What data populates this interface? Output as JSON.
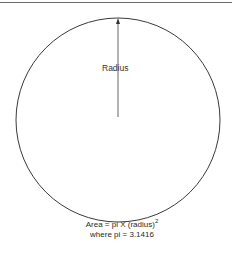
{
  "diagram": {
    "label_radius": "Radius",
    "formula_line1_main": "Area = pi X (radius)",
    "formula_line1_exponent": "2",
    "formula_line2": "where pi = 3.1416",
    "shapes": {
      "circle": {
        "cx": 118,
        "cy": 120,
        "r": 102,
        "stroke": "#3a3a3a"
      },
      "arrow": {
        "x": 118,
        "y_start": 117,
        "y_end": 18,
        "stroke": "#555555"
      },
      "top_rule_color": "#6a6a6a"
    }
  }
}
